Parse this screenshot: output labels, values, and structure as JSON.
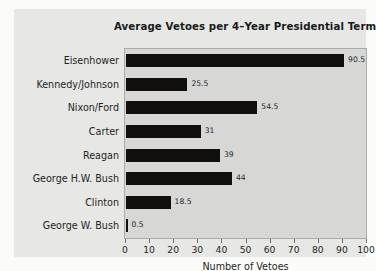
{
  "chart_data": {
    "type": "bar",
    "orientation": "horizontal",
    "title": "Average Vetoes per 4–Year Presidential Term",
    "xlabel": "Number of Vetoes",
    "ylabel": "",
    "xlim": [
      0,
      100
    ],
    "xticks": [
      0,
      10,
      20,
      30,
      40,
      50,
      60,
      70,
      80,
      90,
      100
    ],
    "xtick_labels": [
      "0",
      "10",
      "20",
      "30",
      "40",
      "50",
      "60",
      "70",
      "80",
      "90",
      "100"
    ],
    "grid": false,
    "legend": null,
    "bar_color": "#100f0d",
    "plot_background": "#d7d7d5",
    "categories": [
      "Eisenhower",
      "Kennedy/Johnson",
      "Nixon/Ford",
      "Carter",
      "Reagan",
      "George H.W. Bush",
      "Clinton",
      "George W. Bush"
    ],
    "values": [
      90.5,
      25.5,
      54.5,
      31,
      39,
      44,
      18.5,
      0.5
    ],
    "value_labels": [
      "90.5",
      "25.5",
      "54.5",
      "31",
      "39",
      "44",
      "18.5",
      "0.5"
    ],
    "bars": [
      {
        "category": "Eisenhower",
        "value": 90.5,
        "label": "90.5"
      },
      {
        "category": "Kennedy/Johnson",
        "value": 25.5,
        "label": "25.5"
      },
      {
        "category": "Nixon/Ford",
        "value": 54.5,
        "label": "54.5"
      },
      {
        "category": "Carter",
        "value": 31,
        "label": "31"
      },
      {
        "category": "Reagan",
        "value": 39,
        "label": "39"
      },
      {
        "category": "George H.W. Bush",
        "value": 44,
        "label": "44"
      },
      {
        "category": "Clinton",
        "value": 18.5,
        "label": "18.5"
      },
      {
        "category": "George W. Bush",
        "value": 0.5,
        "label": "0.5"
      }
    ]
  }
}
